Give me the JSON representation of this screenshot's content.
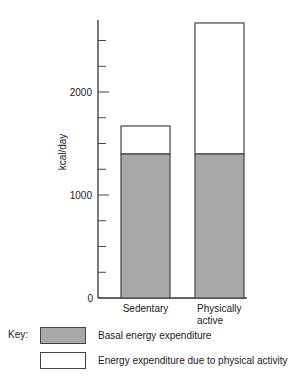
{
  "chart_data": {
    "type": "bar",
    "stacked": true,
    "title": "",
    "xlabel": "",
    "ylabel": "kcal/day",
    "ylim": [
      0,
      2750
    ],
    "yticks_major": [
      0,
      1000,
      2000
    ],
    "ytick_labels": [
      "0",
      "1000",
      "2000"
    ],
    "yticks_minor_step": 250,
    "categories": [
      "Sedentary",
      "Physically active"
    ],
    "category_lines": [
      [
        "Sedentary"
      ],
      [
        "Physically",
        "active"
      ]
    ],
    "series": [
      {
        "name": "Basal energy expenditure",
        "values": [
          1400,
          1400
        ],
        "color": "#a8a8a8"
      },
      {
        "name": "Energy expenditure due to physical activity",
        "values": [
          270,
          1270
        ],
        "color": "#ffffff"
      }
    ],
    "totals": [
      1670,
      2670
    ],
    "grid": false,
    "legend_position": "bottom"
  },
  "legend": {
    "key_label": "Key:",
    "items": [
      {
        "label": "Basal energy expenditure",
        "color": "#a8a8a8"
      },
      {
        "label": "Energy expenditure due to physical activity",
        "color": "#ffffff"
      }
    ]
  }
}
